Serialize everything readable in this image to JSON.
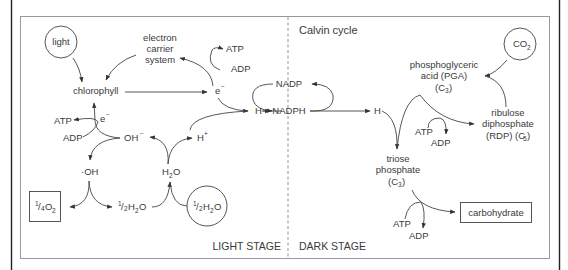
{
  "diagram": {
    "light_stage": {
      "label": "LIGHT STAGE",
      "nodes": {
        "light": "light",
        "electron_carrier_line1": "electron",
        "electron_carrier_line2": "carrier",
        "electron_carrier_line3": "system",
        "chlorophyll": "chlorophyll",
        "atp_top": "ATP",
        "adp_top": "ADP",
        "electron": "e",
        "electron_sup": "−",
        "atp_left": "ATP",
        "adp_left": "ADP",
        "electron_left": "e",
        "electron_left_sup": "−",
        "hydroxide": "OH",
        "hydroxide_sup": "−",
        "hydrogen_ion": "H",
        "hydrogen_ion_sup": "+",
        "hydrogen": "H",
        "hydroxyl_radical": "·OH",
        "water": "H",
        "water_sub": "2",
        "water_o": "O",
        "oxygen_frac_num": "1",
        "oxygen_frac_den": "4",
        "oxygen_o": "O",
        "oxygen_sub": "2",
        "half_water_num": "1",
        "half_water_den": "2",
        "half_water_h": "H",
        "half_water_sub": "2",
        "half_water_o": "O"
      }
    },
    "dark_stage": {
      "label": "DARK STAGE",
      "cycle_label": "Calvin cycle",
      "nodes": {
        "nadp": "NADP",
        "nadph": "NADPH",
        "hydrogen": "H",
        "co2_c": "CO",
        "co2_sub": "2",
        "pga_line1": "phosphoglyceric",
        "pga_line2": "acid (PGA)",
        "pga_line3": "(C",
        "pga_sub": "3",
        "pga_close": ")",
        "rdp_line1": "ribulose",
        "rdp_line2": "diphosphate",
        "rdp_line3": "(RDP) (C",
        "rdp_sub": "5",
        "rdp_close": ")",
        "atp_mid": "ATP",
        "adp_mid": "ADP",
        "triose_line1": "triose",
        "triose_line2": "phosphate",
        "triose_line3": "(C",
        "triose_sub": "3",
        "triose_close": ")",
        "atp_bottom": "ATP",
        "adp_bottom": "ADP",
        "carbohydrate": "carbohydrate"
      }
    },
    "colors": {
      "line": "#444444",
      "frame": "#222222",
      "inner_border": "#999999",
      "text": "#3a3a3a"
    }
  }
}
